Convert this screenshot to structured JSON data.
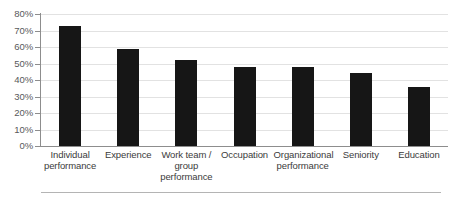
{
  "chart_data": {
    "type": "bar",
    "title": "",
    "subtitle": "",
    "xlabel": "",
    "ylabel": "",
    "categories": [
      "Individual performance",
      "Experience",
      "Work team / group performance",
      "Occupation",
      "Organizational performance",
      "Seniority",
      "Education"
    ],
    "category_lines": [
      [
        "Individual",
        "performance"
      ],
      [
        "Experience"
      ],
      [
        "Work team /",
        "group",
        "performance"
      ],
      [
        "Occupation"
      ],
      [
        "Organizational",
        "performance"
      ],
      [
        "Seniority"
      ],
      [
        "Education"
      ]
    ],
    "values": [
      73,
      59,
      52,
      48,
      48,
      44.5,
      35.5
    ],
    "value_labels": [
      "73%",
      "59%",
      "52%",
      "48%",
      "48%",
      "44%",
      "35%"
    ],
    "ylim": [
      0,
      80
    ],
    "ytick_values": [
      0,
      10,
      20,
      30,
      40,
      50,
      60,
      70,
      80
    ],
    "ytick_labels": [
      "0%",
      "10%",
      "20%",
      "30%",
      "40%",
      "50%",
      "60%",
      "70%",
      "80%"
    ],
    "grid": true,
    "grid_axis": "y",
    "legend": false,
    "legend_position": "none",
    "bar_color": "#161616",
    "grid_color": "#e2e2e2",
    "axis_color": "#8d8d8d",
    "tick_label_color": "#58595b",
    "category_label_color": "#3b3b3b",
    "background_color": "#ffffff",
    "annotations": []
  }
}
